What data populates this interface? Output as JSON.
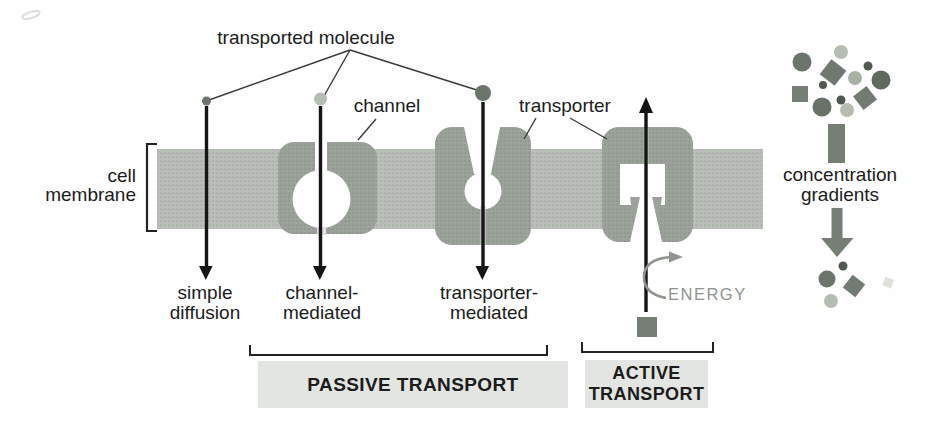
{
  "figure": {
    "title_context": "membrane transport diagram",
    "labels": {
      "transported_molecule": "transported molecule",
      "channel": "channel",
      "transporter": "transporter",
      "cell_membrane": {
        "line1": "cell",
        "line2": "membrane"
      },
      "simple_diffusion": {
        "line1": "simple",
        "line2": "diffusion"
      },
      "channel_mediated": {
        "line1": "channel-",
        "line2": "mediated"
      },
      "transporter_mediated": {
        "line1": "transporter-",
        "line2": "mediated"
      },
      "energy": "ENERGY",
      "passive_transport": "PASSIVE TRANSPORT",
      "active_transport": {
        "line1": "ACTIVE",
        "line2": "TRANSPORT"
      },
      "concentration_gradients": {
        "line1": "concentration",
        "line2": "gradients"
      }
    },
    "colors": {
      "membrane": "#b9beb8",
      "membrane_dot": "#a7ada6",
      "protein": "#99a198",
      "protein_slit": "#cdd1cc",
      "molecule_dark": "#515a51",
      "molecule_medium_dark": "#6b756b",
      "molecule_medium": "#757e75",
      "molecule_light": "#b6bdb2",
      "arrow_black": "#151515",
      "energy_gray": "#8f948f",
      "leader_line": "#3a3a3a",
      "bracket": "#222222",
      "label_box_bg": "#e3e5e2",
      "text": "#1c1c1c"
    }
  }
}
